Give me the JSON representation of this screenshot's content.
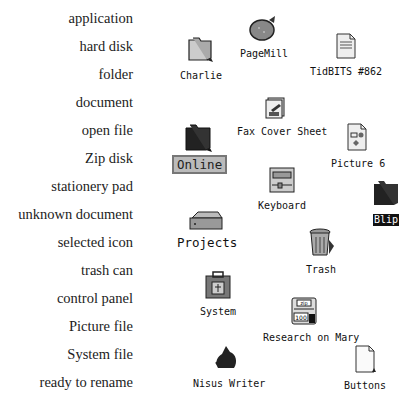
{
  "legend": {
    "items": [
      {
        "label": "application"
      },
      {
        "label": "hard disk"
      },
      {
        "label": "folder"
      },
      {
        "label": "document"
      },
      {
        "label": "open file"
      },
      {
        "label": "Zip disk"
      },
      {
        "label": "stationery pad"
      },
      {
        "label": "unknown document"
      },
      {
        "label": "selected icon"
      },
      {
        "label": "trash can"
      },
      {
        "label": "control panel"
      },
      {
        "label": "Picture file"
      },
      {
        "label": "System file"
      },
      {
        "label": "ready to rename"
      }
    ]
  },
  "desktop": {
    "icons": {
      "pagemill": {
        "name": "PageMill",
        "icon": "application-icon"
      },
      "charlie": {
        "name": "Charlie",
        "icon": "folder-icon"
      },
      "tidbits": {
        "name": "TidBITS #862",
        "icon": "document-icon"
      },
      "fax": {
        "name": "Fax Cover Sheet",
        "icon": "stationery-pad-icon"
      },
      "online": {
        "name": "Online",
        "icon": "folder-icon",
        "state": "ready to rename"
      },
      "picture6": {
        "name": "Picture 6",
        "icon": "picture-file-icon"
      },
      "keyboard": {
        "name": "Keyboard",
        "icon": "control-panel-icon"
      },
      "blip": {
        "name": "Blip",
        "icon": "folder-icon",
        "state": "selected"
      },
      "projects": {
        "name": "Projects",
        "icon": "hard-disk-icon"
      },
      "trash": {
        "name": "Trash",
        "icon": "trash-can-icon"
      },
      "system": {
        "name": "System",
        "icon": "system-file-icon"
      },
      "research": {
        "name": "Research on Mary",
        "icon": "zip-disk-icon",
        "zip_label": "zip",
        "zip_capacity": "100"
      },
      "nisus": {
        "name": "Nisus Writer",
        "icon": "application-icon"
      },
      "buttons": {
        "name": "Buttons",
        "icon": "unknown-document-icon"
      }
    }
  }
}
